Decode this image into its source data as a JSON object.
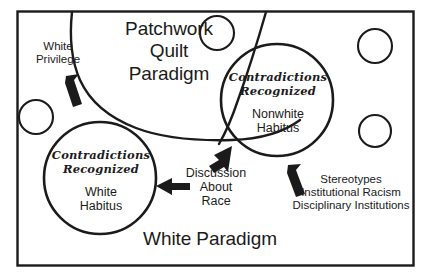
{
  "figure": {
    "frame": {
      "border_color": "#1b1b1b",
      "background": "#ffffff"
    },
    "title": "Patchwork\nQuilt\nParadigm",
    "bottom_label": "White Paradigm",
    "ink_color": "#1b1b1b"
  },
  "circles": {
    "white_habitus": {
      "contradictions": "Contradictions\nRecognized",
      "name": "White\nHabitus"
    },
    "nonwhite_habitus": {
      "contradictions": "Contradictions\nRecognized",
      "name": "Nonwhite\nHabitus"
    }
  },
  "annotations": {
    "white_privilege": "White\nPrivilege",
    "discussion_about_race": "Discussion\nAbout\nRace",
    "stereotypes": "Stereotypes\nInstitutional Racism\nDisciplinary Institutions"
  },
  "decorative": {
    "small_circle_count": 5
  }
}
